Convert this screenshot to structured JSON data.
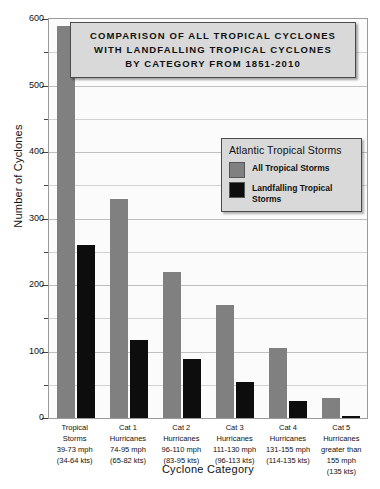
{
  "chart_data": {
    "type": "bar",
    "title_lines": [
      "COMPARISON  OF  ALL  TROPICAL  CYCLONES",
      "WITH  LANDFALLING  TROPICAL  CYCLONES",
      "BY  CATEGORY  FROM 1851-2010"
    ],
    "xlabel": "Cyclone  Category",
    "ylabel": "Number of Cyclones",
    "ylim": [
      0,
      600
    ],
    "yticks": [
      0,
      100,
      200,
      300,
      400,
      500,
      600
    ],
    "yticks_minor": [
      50,
      150,
      250,
      350,
      450,
      550
    ],
    "grid": true,
    "legend_position": "upper-right-inside",
    "categories": [
      "Tropical Storms 39-73 mph (34-64 kts)",
      "Cat 1 Hurricanes 74-95 mph (65-82 kts)",
      "Cat 2 Hurricanes 96-110 mph (83-95 kts)",
      "Cat 3 Hurricanes 111-130 mph (96-113 kts)",
      "Cat 4 Hurricanes 131-155 mph (114-135 kts)",
      "Cat 5 Hurricanes greater than 155 mph (135 kts)"
    ],
    "category_label_lines": [
      [
        "Tropical",
        "Storms",
        "39-73 mph",
        "(34-64 kts)"
      ],
      [
        "Cat 1",
        "Hurricanes",
        "74-95 mph",
        "(65-82 kts)"
      ],
      [
        "Cat 2",
        "Hurricanes",
        "96-110 mph",
        "(83-95 kts)"
      ],
      [
        "Cat 3",
        "Hurricanes",
        "111-130 mph",
        "(96-113 kts)"
      ],
      [
        "Cat 4",
        "Hurricanes",
        "131-155 mph",
        "(114-135 kts)"
      ],
      [
        "Cat 5",
        "Hurricanes",
        "greater than",
        "155 mph",
        "(135 kts)"
      ]
    ],
    "series": [
      {
        "name": "All Tropical Storms",
        "color": "#808080",
        "values": [
          590,
          330,
          220,
          170,
          105,
          30
        ]
      },
      {
        "name": "Landfalling Tropical Storms",
        "color": "#0d0d0d",
        "values": [
          260,
          118,
          89,
          54,
          25,
          3
        ]
      }
    ]
  },
  "legend": {
    "title": "Atlantic Tropical Storms",
    "entries": [
      {
        "label": "All Tropical Storms",
        "color": "#808080"
      },
      {
        "label": "Landfalling Tropical Storms",
        "color": "#0d0d0d",
        "lines": [
          "Landfalling",
          "Tropical Storms"
        ]
      }
    ]
  },
  "axes": {
    "y_title": "Number of Cyclones",
    "x_title": "Cyclone  Category",
    "y_tick_labels": [
      "0",
      "100",
      "200",
      "300",
      "400",
      "500",
      "600"
    ]
  }
}
